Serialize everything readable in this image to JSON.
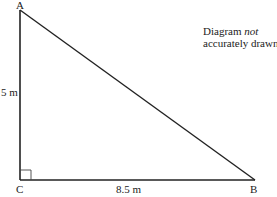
{
  "diagram": {
    "type": "right-angled triangle",
    "vertices": {
      "A": {
        "label": "A",
        "x": 20,
        "y": 10
      },
      "B": {
        "label": "B",
        "x": 255,
        "y": 180
      },
      "C": {
        "label": "C",
        "x": 20,
        "y": 180
      }
    },
    "right_angle_at": "C",
    "sides": {
      "AC": {
        "label": "5 m"
      },
      "CB": {
        "label": "8.5 m"
      }
    },
    "note": {
      "prefix": "Diagram ",
      "emphasis": "not",
      "suffix": "accurately drawn"
    },
    "colors": {
      "line": "#222222",
      "background": "#ffffff"
    }
  }
}
